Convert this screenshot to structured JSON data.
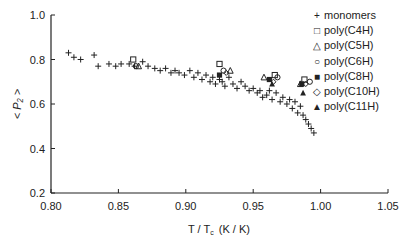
{
  "chart_data": {
    "type": "scatter",
    "title": "",
    "xlabel": "T / T_c  (K / K)",
    "ylabel": "< P_2 >",
    "xlim": [
      0.8,
      1.05
    ],
    "ylim": [
      0.2,
      1.0
    ],
    "xticks": [
      "0.80",
      "0.85",
      "0.90",
      "0.95",
      "1.00",
      "1.05"
    ],
    "yticks": [
      "0.2",
      "0.4",
      "0.6",
      "0.8",
      "1.0"
    ],
    "grid": false,
    "legend_position": "right-top",
    "series": [
      {
        "name": "monomers",
        "marker": "plus",
        "x": [
          0.813,
          0.817,
          0.822,
          0.832,
          0.835,
          0.843,
          0.848,
          0.852,
          0.858,
          0.862,
          0.868,
          0.872,
          0.877,
          0.881,
          0.885,
          0.889,
          0.892,
          0.895,
          0.899,
          0.903,
          0.906,
          0.909,
          0.912,
          0.915,
          0.918,
          0.92,
          0.922,
          0.925,
          0.927,
          0.929,
          0.932,
          0.935,
          0.938,
          0.941,
          0.944,
          0.947,
          0.95,
          0.953,
          0.955,
          0.957,
          0.96,
          0.962,
          0.964,
          0.967,
          0.97,
          0.972,
          0.975,
          0.977,
          0.979,
          0.981,
          0.983,
          0.985,
          0.987,
          0.989,
          0.991,
          0.993,
          0.995
        ],
        "y": [
          0.83,
          0.81,
          0.8,
          0.82,
          0.77,
          0.78,
          0.77,
          0.78,
          0.78,
          0.77,
          0.79,
          0.77,
          0.76,
          0.75,
          0.76,
          0.74,
          0.75,
          0.74,
          0.73,
          0.75,
          0.72,
          0.74,
          0.71,
          0.73,
          0.7,
          0.72,
          0.69,
          0.71,
          0.7,
          0.68,
          0.72,
          0.69,
          0.67,
          0.7,
          0.68,
          0.66,
          0.67,
          0.65,
          0.66,
          0.63,
          0.64,
          0.66,
          0.62,
          0.65,
          0.61,
          0.63,
          0.6,
          0.62,
          0.58,
          0.61,
          0.56,
          0.59,
          0.55,
          0.53,
          0.51,
          0.49,
          0.47
        ]
      },
      {
        "name": "poly(C4H)",
        "marker": "square-open",
        "x": [
          0.861,
          0.925,
          0.966,
          0.988
        ],
        "y": [
          0.8,
          0.78,
          0.73,
          0.71
        ]
      },
      {
        "name": "poly(C5H)",
        "marker": "triangle-open",
        "x": [
          0.865,
          0.933,
          0.958,
          0.985
        ],
        "y": [
          0.77,
          0.75,
          0.72,
          0.69
        ]
      },
      {
        "name": "poly(C6H)",
        "marker": "circle-open",
        "x": [
          0.863,
          0.928,
          0.968,
          0.992
        ],
        "y": [
          0.77,
          0.75,
          0.72,
          0.7
        ]
      },
      {
        "name": "poly(C8H)",
        "marker": "square-filled",
        "x": [
          0.925,
          0.962,
          0.986
        ],
        "y": [
          0.73,
          0.71,
          0.69
        ]
      },
      {
        "name": "poly(C10H)",
        "marker": "diamond-open",
        "x": [
          0.93,
          0.965,
          0.989
        ],
        "y": [
          0.74,
          0.7,
          0.69
        ]
      },
      {
        "name": "poly(C11H)",
        "marker": "triangle-filled",
        "x": [
          0.964,
          0.987
        ],
        "y": [
          0.69,
          0.65
        ]
      }
    ]
  },
  "legend": {
    "items": [
      {
        "symbol": "+",
        "label": "monomers"
      },
      {
        "symbol": "□",
        "label": "poly(C4H)"
      },
      {
        "symbol": "△",
        "label": "poly(C5H)"
      },
      {
        "symbol": "○",
        "label": "poly(C6H)"
      },
      {
        "symbol": "■",
        "label": "poly(C8H)"
      },
      {
        "symbol": "◇",
        "label": "poly(C10H)"
      },
      {
        "symbol": "▲",
        "label": "poly(C11H)"
      }
    ]
  },
  "axes": {
    "xlabel_main": "T / T",
    "xlabel_sub": "c",
    "xlabel_units": "(K / K)",
    "ylabel": "< P₂ >"
  }
}
